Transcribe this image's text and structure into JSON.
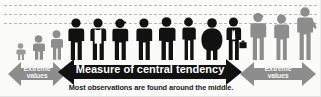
{
  "figure": {
    "background_color": "#fbfbfa",
    "gridlines": {
      "count": 3,
      "color": "#b9b9b9",
      "style": "dashed",
      "y_positions": [
        5,
        14,
        23
      ]
    },
    "people": {
      "total": 14,
      "left_group_count": 3,
      "center_group_count": 8,
      "right_group_count": 3,
      "left_color": "#8d8d8d",
      "center_color": "#111111",
      "right_color": "#8d8d8d",
      "silhouettes": [
        {
          "group": "left",
          "variant": "child",
          "height_px": 17,
          "color": "#9a9a9a"
        },
        {
          "group": "left",
          "variant": "short",
          "height_px": 25,
          "color": "#8d8d8d"
        },
        {
          "group": "left",
          "variant": "short",
          "height_px": 30,
          "color": "#8d8d8d"
        },
        {
          "group": "center",
          "variant": "plain",
          "height_px": 42,
          "color": "#111111"
        },
        {
          "group": "center",
          "variant": "apron",
          "height_px": 42,
          "color": "#111111"
        },
        {
          "group": "center",
          "variant": "cap",
          "height_px": 42,
          "color": "#111111"
        },
        {
          "group": "center",
          "variant": "plain",
          "height_px": 42,
          "color": "#111111"
        },
        {
          "group": "center",
          "variant": "plain",
          "height_px": 43,
          "color": "#111111"
        },
        {
          "group": "center",
          "variant": "slim",
          "height_px": 43,
          "color": "#111111"
        },
        {
          "group": "center",
          "variant": "heavyset",
          "height_px": 42,
          "color": "#111111"
        },
        {
          "group": "center",
          "variant": "briefcase",
          "height_px": 43,
          "color": "#111111"
        },
        {
          "group": "right",
          "variant": "tall",
          "height_px": 48,
          "color": "#8d8d8d"
        },
        {
          "group": "right",
          "variant": "tall",
          "height_px": 46,
          "color": "#8d8d8d"
        },
        {
          "group": "right",
          "variant": "tallest",
          "height_px": 53,
          "color": "#8d8d8d"
        }
      ]
    },
    "arrows": {
      "left": {
        "label_line1": "Extreme",
        "label_line2": "values",
        "color": "#8d8d8d",
        "text_color": "#ffffff",
        "direction": "double"
      },
      "center": {
        "label": "Measure of central tendency",
        "color": "#111111",
        "text_color": "#ffffff",
        "direction": "double"
      },
      "right": {
        "label_line1": "Extreme",
        "label_line2": "values",
        "color": "#8d8d8d",
        "text_color": "#ffffff",
        "direction": "double"
      }
    },
    "subtitle": "Most observations are found around the middle."
  }
}
